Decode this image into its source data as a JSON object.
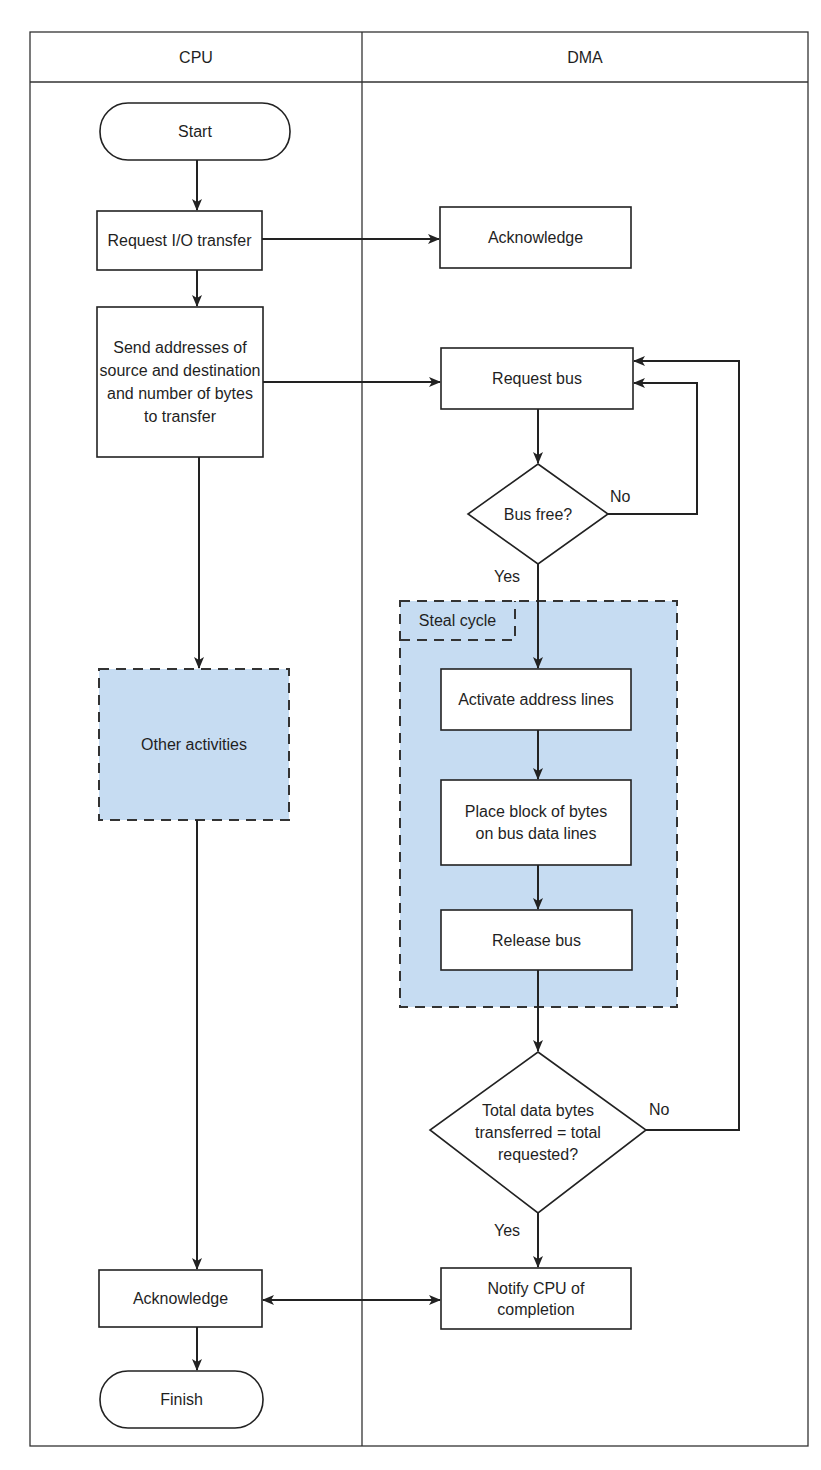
{
  "diagram": {
    "type": "swimlane-flowchart",
    "colors": {
      "stroke": "#222222",
      "dashed_fill": "#c6dcf2",
      "background": "#ffffff"
    },
    "lanes": [
      {
        "id": "cpu",
        "title": "CPU"
      },
      {
        "id": "dma",
        "title": "DMA"
      }
    ],
    "nodes": {
      "start": {
        "lane": "cpu",
        "shape": "terminator",
        "label": "Start"
      },
      "request_io": {
        "lane": "cpu",
        "shape": "process",
        "label": "Request I/O transfer"
      },
      "send_addresses": {
        "lane": "cpu",
        "shape": "process",
        "label": "Send addresses of\nsource and destination\nand number of bytes\nto transfer"
      },
      "other_activities": {
        "lane": "cpu",
        "shape": "dashed-process",
        "label": "Other activities"
      },
      "cpu_acknowledge": {
        "lane": "cpu",
        "shape": "process",
        "label": "Acknowledge"
      },
      "finish": {
        "lane": "cpu",
        "shape": "terminator",
        "label": "Finish"
      },
      "dma_acknowledge": {
        "lane": "dma",
        "shape": "process",
        "label": "Acknowledge"
      },
      "request_bus": {
        "lane": "dma",
        "shape": "process",
        "label": "Request bus"
      },
      "bus_free": {
        "lane": "dma",
        "shape": "decision",
        "label": "Bus free?"
      },
      "steal_cycle": {
        "lane": "dma",
        "shape": "dashed-group",
        "label": "Steal cycle"
      },
      "activate_address": {
        "lane": "dma",
        "shape": "process",
        "label": "Activate address lines"
      },
      "place_block": {
        "lane": "dma",
        "shape": "process",
        "label": "Place block of bytes\non bus data lines"
      },
      "release_bus": {
        "lane": "dma",
        "shape": "process",
        "label": "Release bus"
      },
      "total_check": {
        "lane": "dma",
        "shape": "decision",
        "label": "Total data bytes\ntransferred = total\nrequested?"
      },
      "notify_cpu": {
        "lane": "dma",
        "shape": "process",
        "label": "Notify CPU of\ncompletion"
      }
    },
    "edges": [
      {
        "from": "start",
        "to": "request_io",
        "label": ""
      },
      {
        "from": "request_io",
        "to": "send_addresses",
        "label": ""
      },
      {
        "from": "request_io",
        "to": "dma_acknowledge",
        "label": ""
      },
      {
        "from": "send_addresses",
        "to": "request_bus",
        "label": ""
      },
      {
        "from": "send_addresses",
        "to": "other_activities",
        "label": ""
      },
      {
        "from": "request_bus",
        "to": "bus_free",
        "label": ""
      },
      {
        "from": "bus_free",
        "to": "request_bus",
        "label": "No"
      },
      {
        "from": "bus_free",
        "to": "activate_address",
        "label": "Yes"
      },
      {
        "from": "activate_address",
        "to": "place_block",
        "label": ""
      },
      {
        "from": "place_block",
        "to": "release_bus",
        "label": ""
      },
      {
        "from": "release_bus",
        "to": "total_check",
        "label": ""
      },
      {
        "from": "total_check",
        "to": "request_bus",
        "label": "No"
      },
      {
        "from": "total_check",
        "to": "notify_cpu",
        "label": "Yes"
      },
      {
        "from": "notify_cpu",
        "to": "cpu_acknowledge",
        "label": "",
        "bidirectional": true
      },
      {
        "from": "other_activities",
        "to": "cpu_acknowledge",
        "label": ""
      },
      {
        "from": "cpu_acknowledge",
        "to": "finish",
        "label": ""
      }
    ],
    "edge_labels": {
      "bus_free_no": "No",
      "bus_free_yes": "Yes",
      "total_no": "No",
      "total_yes": "Yes"
    }
  }
}
